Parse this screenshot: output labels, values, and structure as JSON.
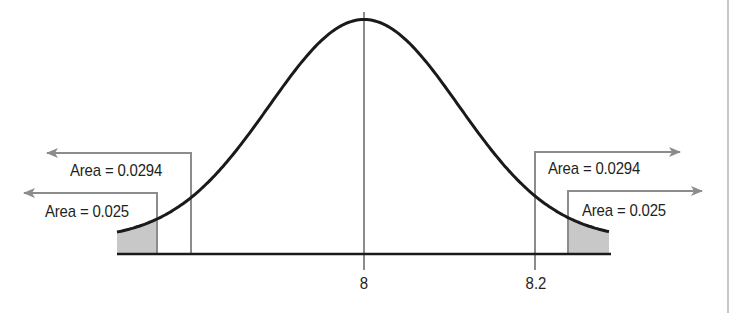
{
  "chart_data": {
    "type": "normal-distribution-diagram",
    "title": "",
    "distribution": {
      "mean": 8,
      "shape": "bell curve"
    },
    "x_tick_labels": [
      "8",
      "8.2"
    ],
    "annotations": [
      {
        "side": "left",
        "label": "Area = 0.0294",
        "arrow": "left",
        "shaded": false
      },
      {
        "side": "left",
        "label": "Area = 0.025",
        "arrow": "left",
        "shaded": true
      },
      {
        "side": "right",
        "label": "Area = 0.0294",
        "arrow": "right",
        "shaded": false
      },
      {
        "side": "right",
        "label": "Area = 0.025",
        "arrow": "right",
        "shaded": true
      }
    ],
    "geometry": {
      "center_px": 364,
      "sigma_px": 95,
      "baseline_y": 254,
      "amplitude": 220,
      "offset": 14.5,
      "curve_x": [
        117,
        609
      ],
      "left_shade_end": 157,
      "left_line": 191,
      "right_line": 535,
      "right_shade_start": 568
    }
  },
  "labels": {
    "left_outer": "Area = 0.0294",
    "left_inner": "Area = 0.025",
    "right_outer": "Area = 0.0294",
    "right_inner": "Area = 0.025",
    "tick_mean": "8",
    "tick_value": "8.2"
  },
  "colors": {
    "curve": "#1a1a1a",
    "guide_lines": "#8c8c8c",
    "shade": "#c8c8c8",
    "baseline": "#1a1a1a",
    "text": "#231f20"
  }
}
